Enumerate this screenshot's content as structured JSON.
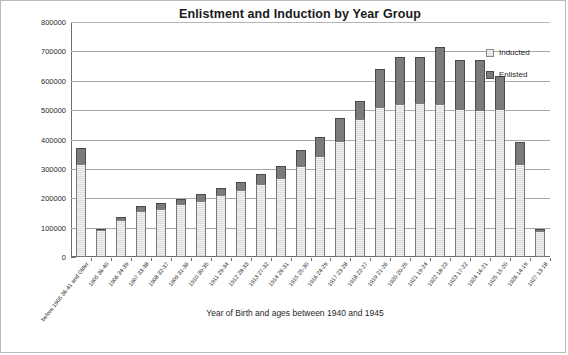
{
  "chart_data": {
    "type": "bar",
    "stacked": true,
    "title": "Enlistment and Induction by Year Group",
    "xlabel": "Year of Birth and ages between 1940 and 1945",
    "ylabel": "",
    "ylim": [
      0,
      800000
    ],
    "ytick_step": 100000,
    "ytick_labels": [
      "800000",
      "700000",
      "600000",
      "500000",
      "400000",
      "300000",
      "200000",
      "100000",
      "0"
    ],
    "ytick_values": [
      800000,
      700000,
      600000,
      500000,
      400000,
      300000,
      200000,
      100000,
      0
    ],
    "grid": true,
    "legend_position": "right",
    "categories": [
      "before 1905 36-41 and Older",
      "1905 36-40",
      "1906 34-39",
      "1907 33-38",
      "1908 32-37",
      "1909 31-36",
      "1910 30-35",
      "1911 29-34",
      "1912 28-33",
      "1913 27-32",
      "1914 26-31",
      "1915 25-30",
      "1916 24-29",
      "1917 23-28",
      "1918 22-27",
      "1919 21-26",
      "1920 20-25",
      "1921 19-24",
      "1922 18-23",
      "1923 17-22",
      "1924 16-21",
      "1925 15-20",
      "1926 14-19",
      "1927 13-18"
    ],
    "series": [
      {
        "name": "Inducted",
        "color": "#f0f0f0",
        "values": [
          318000,
          92000,
          125000,
          158000,
          165000,
          180000,
          192000,
          212000,
          228000,
          250000,
          270000,
          310000,
          345000,
          395000,
          470000,
          510000,
          520000,
          525000,
          520000,
          505000,
          500000,
          505000,
          315000,
          88000
        ]
      },
      {
        "name": "Enlisted",
        "color": "#7b7b7b",
        "values": [
          52000,
          4000,
          12000,
          15000,
          18000,
          18000,
          22000,
          22000,
          27000,
          33000,
          40000,
          53000,
          62000,
          78000,
          62000,
          130000,
          162000,
          155000,
          195000,
          165000,
          170000,
          110000,
          75000,
          8000
        ]
      }
    ],
    "totals": [
      370000,
      96000,
      137000,
      173000,
      183000,
      198000,
      214000,
      234000,
      255000,
      283000,
      310000,
      363000,
      407000,
      473000,
      532000,
      640000,
      682000,
      680000,
      715000,
      670000,
      670000,
      615000,
      390000,
      96000
    ]
  },
  "legend": {
    "entries": [
      {
        "label": "Inducted",
        "swatch": "inducted"
      },
      {
        "label": "Enlisted",
        "swatch": "enlisted"
      }
    ]
  }
}
